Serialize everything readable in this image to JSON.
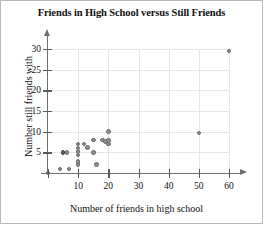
{
  "chart_data": {
    "type": "scatter",
    "title": "Friends in High School versus Still Friends",
    "xlabel": "Number of friends in high school",
    "ylabel": "Number still friends with",
    "xlim": [
      0,
      63
    ],
    "ylim": [
      0,
      31
    ],
    "grid": true,
    "legend": null,
    "marker_color": "#8e8e8e",
    "xticks": [
      0,
      10,
      20,
      30,
      40,
      50,
      60
    ],
    "xticklabels": [
      "",
      "10",
      "20",
      "30",
      "40",
      "50",
      "60"
    ],
    "yticks": [
      5,
      10,
      15,
      20,
      25,
      30
    ],
    "yticklabels": [
      "5",
      "10",
      "15",
      "20",
      "25",
      "30"
    ],
    "points": [
      {
        "x": 0,
        "y": 0,
        "dark": true
      },
      {
        "x": 4,
        "y": 1,
        "dark": false
      },
      {
        "x": 5,
        "y": 5,
        "dark": true
      },
      {
        "x": 6.3,
        "y": 5,
        "dark": false
      },
      {
        "x": 7,
        "y": 1,
        "dark": false
      },
      {
        "x": 10,
        "y": 2,
        "dark": false
      },
      {
        "x": 10,
        "y": 2.8,
        "dark": false
      },
      {
        "x": 10,
        "y": 4.4,
        "dark": false
      },
      {
        "x": 10,
        "y": 5.2,
        "dark": false
      },
      {
        "x": 10,
        "y": 6,
        "dark": false
      },
      {
        "x": 10,
        "y": 7,
        "dark": false
      },
      {
        "x": 12,
        "y": 7,
        "dark": false
      },
      {
        "x": 13,
        "y": 6.2,
        "dark": false
      },
      {
        "x": 15,
        "y": 5,
        "dark": false
      },
      {
        "x": 15,
        "y": 8,
        "dark": false
      },
      {
        "x": 16,
        "y": 2,
        "dark": false
      },
      {
        "x": 18,
        "y": 8,
        "dark": false
      },
      {
        "x": 19,
        "y": 7.6,
        "dark": false
      },
      {
        "x": 20,
        "y": 7,
        "dark": false
      },
      {
        "x": 20,
        "y": 7.8,
        "dark": false
      },
      {
        "x": 20,
        "y": 10,
        "dark": false
      },
      {
        "x": 50,
        "y": 9.7,
        "dark": false
      },
      {
        "x": 60,
        "y": 29.5,
        "dark": false
      }
    ]
  }
}
